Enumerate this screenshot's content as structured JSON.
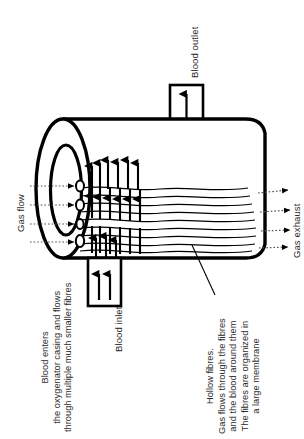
{
  "figure": {
    "background_color": "#ffffff",
    "ink_color": "#000000",
    "text_color": "#2b2b2b"
  },
  "labels": {
    "blood_outlet": "Blood outlet",
    "blood_inlet": "Blood inlet",
    "gas_flow": "Gas flow",
    "gas_exhaust": "Gas exhaust"
  },
  "annotations": {
    "blood_path": {
      "lines": [
        "Blood enters",
        "the oxygenator casing and flows",
        "through multiple much smaller fibres"
      ]
    },
    "hollow_fibres": {
      "lines": [
        "Hollow fibres.",
        "Gas flows through the fibres",
        "and the blood around them",
        "The fibres are organized in",
        "a large membrane"
      ]
    }
  },
  "parts": {
    "casing": "oxygenator-casing-cylinder",
    "left_face": "annular-end-face",
    "fibres": "hollow-fibre-bundle",
    "blood_arrows": "blood-flow-arrows",
    "gas_inlet_arrows": "gas-inlet-dotted-arrows",
    "gas_exhaust_arrows": "gas-exhaust-dotted-arrows"
  }
}
